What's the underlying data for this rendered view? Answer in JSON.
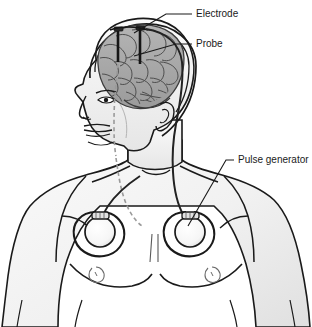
{
  "figure": {
    "background_color": "#ffffff",
    "line_color": "#1a1a1a",
    "skin_fill": "#f2f2f2",
    "skin_shadow": "#e2e2e2",
    "brain_fill": "#a8a8a8",
    "brain_line": "#4a4a4a",
    "device_fill": "#fbfbfb",
    "lead_color": "#222222",
    "dashed_color": "#9a9a9a"
  },
  "labels": [
    {
      "id": "electrode",
      "text": "Electrode",
      "text_x": 196,
      "text_y": 14,
      "leader": "M192,14 L166,14 L134,36"
    },
    {
      "id": "probe",
      "text": "Probe",
      "text_x": 196,
      "text_y": 44,
      "leader": "M192,44 L176,44 L132,56"
    },
    {
      "id": "pulse-generator",
      "text": "Pulse generator",
      "text_x": 238,
      "text_y": 160,
      "leader": "M234,160 L224,160 L186,228"
    }
  ],
  "anatomy": {
    "head": "head-profile-outline",
    "skull": "skull-outline",
    "brain": "brain-with-gyri",
    "ear": "ear-outline",
    "neck": "neck-outline",
    "torso": "shoulders-chest-arms",
    "nipple_left": "nipple-left",
    "nipple_right": "nipple-right",
    "sternum": "sternum-crease"
  },
  "implants": [
    {
      "id": "probe-left",
      "type": "depth-electrode-probe",
      "x": 118,
      "y_top": 30,
      "y_bottom": 60
    },
    {
      "id": "probe-right",
      "type": "depth-electrode-probe",
      "x": 140,
      "y_top": 30,
      "y_bottom": 62
    },
    {
      "id": "pulse-generator-left",
      "type": "implanted-pulse-generator",
      "cx": 100,
      "cy": 230,
      "r": 17
    },
    {
      "id": "pulse-generator-right",
      "type": "implanted-pulse-generator",
      "cx": 190,
      "cy": 230,
      "r": 17
    }
  ],
  "leads": [
    {
      "id": "lead-scalp-to-neck",
      "description": "Extension lead from skull down behind ear through neck"
    },
    {
      "id": "lead-tunnel-dashed",
      "description": "Subcutaneous tunneling path shown dashed along face and jaw"
    }
  ]
}
